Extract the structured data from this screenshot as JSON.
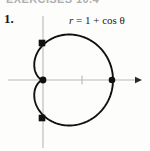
{
  "figure": {
    "header_remnant": "EXERCISES 10.4",
    "exercise_number": "1.",
    "equation": {
      "r_symbol": "r",
      "body": " = 1 + cos θ",
      "full": "r = 1 + cos θ"
    },
    "colors": {
      "background": "#fdfdfc",
      "curve": "#111111",
      "axis": "#b9b9b9",
      "marker": "#111111",
      "text": "#1a1a1a"
    }
  },
  "chart_data": {
    "type": "line",
    "plot_kind": "polar-curve",
    "title": "",
    "annotations": [
      "r = 1 + cos θ"
    ],
    "equation": "r = 1 + cos(theta)",
    "curve_name": "cardioid",
    "xlabel": "",
    "ylabel": "",
    "grid": false,
    "legend": false,
    "axes": {
      "x_axis": {
        "visible": true,
        "y_pixel": 80,
        "x_start_pixel": 8,
        "x_end_pixel": 142,
        "arrow": "right",
        "ticks_pixel": [
          82
        ]
      },
      "y_axis": {
        "visible": true,
        "x_pixel": 43,
        "y_start_pixel": 16,
        "y_end_pixel": 148,
        "arrow": "none",
        "ticks_pixel": []
      },
      "origin_pixel": [
        43,
        80
      ],
      "unit_pixels": 35
    },
    "marked_points": [
      {
        "label": "cusp",
        "theta_deg": 180,
        "r": 0,
        "polar": [
          0,
          180
        ],
        "cartesian": [
          0,
          0
        ],
        "pixel": [
          43,
          80
        ],
        "marker": "filled-circle"
      },
      {
        "label": "max",
        "theta_deg": 0,
        "r": 2,
        "polar": [
          2,
          0
        ],
        "cartesian": [
          2,
          0
        ],
        "pixel": [
          112,
          80
        ],
        "marker": "filled-circle"
      },
      {
        "label": "upper",
        "theta_deg": 90,
        "r": 1,
        "polar": [
          1,
          90
        ],
        "cartesian": [
          0,
          1
        ],
        "pixel": [
          42,
          43
        ],
        "marker": "filled-square"
      },
      {
        "label": "lower",
        "theta_deg": 270,
        "r": 1,
        "polar": [
          1,
          270
        ],
        "cartesian": [
          0,
          -1
        ],
        "pixel": [
          42,
          118
        ],
        "marker": "filled-square"
      }
    ],
    "theta": [
      0,
      15,
      30,
      45,
      60,
      75,
      90,
      105,
      120,
      135,
      150,
      165,
      180,
      195,
      210,
      225,
      240,
      255,
      270,
      285,
      300,
      315,
      330,
      345,
      360
    ],
    "r": [
      2.0,
      1.966,
      1.866,
      1.707,
      1.5,
      1.259,
      1.0,
      0.741,
      0.5,
      0.293,
      0.134,
      0.034,
      0.0,
      0.034,
      0.134,
      0.293,
      0.5,
      0.741,
      1.0,
      1.259,
      1.5,
      1.707,
      1.866,
      1.966,
      2.0
    ],
    "x": [
      2.0,
      1.899,
      1.616,
      1.207,
      0.75,
      0.326,
      0.0,
      -0.192,
      -0.25,
      -0.207,
      -0.116,
      -0.033,
      0.0,
      -0.033,
      -0.116,
      -0.207,
      -0.25,
      -0.192,
      0.0,
      0.326,
      0.75,
      1.207,
      1.616,
      1.899,
      2.0
    ],
    "y": [
      0.0,
      0.509,
      0.933,
      1.207,
      1.299,
      1.216,
      1.0,
      0.716,
      0.433,
      0.207,
      0.067,
      0.009,
      0.0,
      -0.009,
      -0.067,
      -0.207,
      -0.433,
      -0.716,
      -1.0,
      -1.216,
      -1.299,
      -1.207,
      -0.933,
      -0.509,
      0.0
    ],
    "xlim": [
      -1.0,
      2.83
    ],
    "ylim": [
      -1.83,
      1.83
    ]
  }
}
